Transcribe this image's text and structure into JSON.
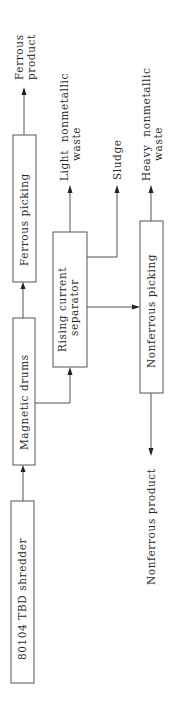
{
  "diagram": {
    "type": "process-flowchart",
    "orientation": "rotated-90-ccw",
    "nodes": [
      {
        "id": "shredder",
        "label": "80104 TBD shredder"
      },
      {
        "id": "magnetic_drums",
        "label": "Magnetic drums"
      },
      {
        "id": "ferrous_picking",
        "label": "Ferrous picking"
      },
      {
        "id": "rising_current",
        "label": "Rising current separator",
        "lines": [
          "Rising current",
          "separator"
        ]
      },
      {
        "id": "nonferrous_picking",
        "label": "Nonferrous picking"
      }
    ],
    "outputs": [
      {
        "id": "ferrous_product",
        "label": "Ferrous product",
        "lines": [
          "Ferrous",
          "product"
        ]
      },
      {
        "id": "light_waste",
        "label": "Light nonmetallic waste",
        "lines": [
          "Light  nonmetallic",
          "waste"
        ]
      },
      {
        "id": "sludge",
        "label": "Sludge"
      },
      {
        "id": "heavy_waste",
        "label": "Heavy nonmetallic waste",
        "lines": [
          "Heavy  nonmetallic",
          "waste"
        ]
      },
      {
        "id": "nonferrous_product",
        "label": "Nonferrous product"
      }
    ],
    "edges": [
      [
        "shredder",
        "magnetic_drums"
      ],
      [
        "magnetic_drums",
        "ferrous_picking"
      ],
      [
        "magnetic_drums",
        "rising_current"
      ],
      [
        "ferrous_picking",
        "ferrous_product"
      ],
      [
        "rising_current",
        "light_waste"
      ],
      [
        "rising_current",
        "sludge"
      ],
      [
        "rising_current",
        "nonferrous_picking"
      ],
      [
        "nonferrous_picking",
        "heavy_waste"
      ],
      [
        "nonferrous_picking",
        "nonferrous_product"
      ]
    ]
  }
}
